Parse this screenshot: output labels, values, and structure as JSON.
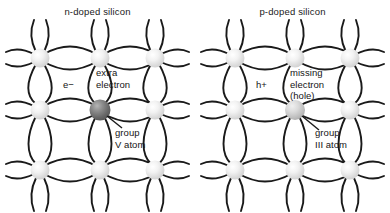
{
  "diagram": {
    "title_left": "n-doped silicon",
    "title_right": "p-doped silicon",
    "background": "#ffffff",
    "bond_color": "#1a1a1a",
    "atom_color_light": "#e8e8e8",
    "atom_color_dopant_n": "#6f6f6f",
    "atom_color_dopant_p": "#c9c9c9"
  },
  "panels": [
    {
      "id": "n-doped",
      "title": "n-doped silicon",
      "dopant_label_line1": "group",
      "dopant_label_line2": "V atom",
      "carrier_symbol": "e−",
      "carrier_label_line1": "extra",
      "carrier_label_line2": "electron",
      "carrier_label_line3": "",
      "dopant_type": "donor",
      "atom_grid_cols": 3,
      "atom_grid_rows": 3
    },
    {
      "id": "p-doped",
      "title": "p-doped silicon",
      "dopant_label_line1": "group",
      "dopant_label_line2": "III atom",
      "carrier_symbol": "h+",
      "carrier_label_line1": "missing",
      "carrier_label_line2": "electron",
      "carrier_label_line3": "(hole)",
      "dopant_type": "acceptor",
      "atom_grid_cols": 3,
      "atom_grid_rows": 3
    }
  ]
}
